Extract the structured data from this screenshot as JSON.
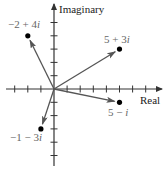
{
  "figure": {
    "type": "complex-plane",
    "axes": {
      "x_label": "Real",
      "y_label": "Imaginary",
      "x_range": [
        -3,
        7
      ],
      "y_range": [
        -5,
        5
      ],
      "tick_step": 1
    },
    "colors": {
      "axis": "#333333",
      "vector": "#555555",
      "point": "#000000",
      "point_label": "#666666",
      "axis_label": "#222222"
    },
    "points": [
      {
        "re": -2,
        "im": 4,
        "label_a": "−2 + 4",
        "label_i": "i"
      },
      {
        "re": 5,
        "im": 3,
        "label_a": "5 + 3",
        "label_i": "i"
      },
      {
        "re": 5,
        "im": -1,
        "label_a": "5 − ",
        "label_i": "i"
      },
      {
        "re": -1,
        "im": -3,
        "label_a": "−1 − 3",
        "label_i": "i"
      }
    ]
  }
}
